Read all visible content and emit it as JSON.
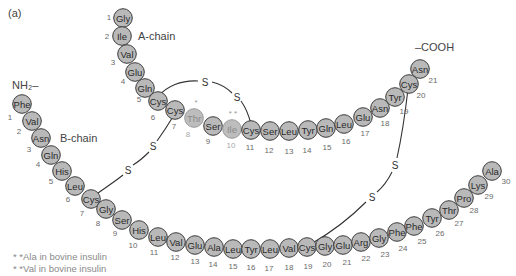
{
  "figure": {
    "panel_label": "(a)",
    "a_chain_label": "A-chain",
    "b_chain_label": "B-chain",
    "n_terminus_label": "NH₂–",
    "c_terminus_label": "–COOH",
    "disulfide_symbol": "S",
    "footnotes": [
      "* *Ala in bovine insulin",
      "* *Val in bovine insulin"
    ],
    "variant_markers": {
      "thr8": "*",
      "ile10": "* *"
    },
    "colors": {
      "residue_fill": "#b9b9b9",
      "residue_stroke": "#3a3a3a",
      "variant_text": "#8a8a8a",
      "bond": "#333333"
    }
  },
  "a_chain": [
    {
      "n": 1,
      "aa": "Gly",
      "x": 123,
      "y": 18,
      "nx": 109,
      "ny": 17
    },
    {
      "n": 2,
      "aa": "Ile",
      "x": 122,
      "y": 36,
      "nx": 107,
      "ny": 36
    },
    {
      "n": 3,
      "aa": "Val",
      "x": 127,
      "y": 54,
      "nx": 113,
      "ny": 62
    },
    {
      "n": 4,
      "aa": "Glu",
      "x": 135,
      "y": 72,
      "nx": 123,
      "ny": 81
    },
    {
      "n": 5,
      "aa": "Gln",
      "x": 145,
      "y": 88,
      "nx": 139,
      "ny": 99
    },
    {
      "n": 6,
      "aa": "Cys",
      "x": 158,
      "y": 101,
      "nx": 153,
      "ny": 117
    },
    {
      "n": 7,
      "aa": "Cys",
      "x": 175,
      "y": 110,
      "nx": 174,
      "ny": 126
    },
    {
      "n": 8,
      "aa": "Thr",
      "x": 194,
      "y": 118,
      "nx": 188,
      "ny": 134,
      "variant": true
    },
    {
      "n": 9,
      "aa": "Ser",
      "x": 213,
      "y": 126,
      "nx": 208,
      "ny": 141
    },
    {
      "n": 10,
      "aa": "Ile",
      "x": 232,
      "y": 129,
      "nx": 231,
      "ny": 145,
      "variant": true
    },
    {
      "n": 11,
      "aa": "Cys",
      "x": 251,
      "y": 130,
      "nx": 250,
      "ny": 147
    },
    {
      "n": 12,
      "aa": "Ser",
      "x": 270,
      "y": 131,
      "nx": 269,
      "ny": 150
    },
    {
      "n": 13,
      "aa": "Leu",
      "x": 289,
      "y": 131,
      "nx": 289,
      "ny": 151
    },
    {
      "n": 14,
      "aa": "Tyr",
      "x": 308,
      "y": 130,
      "nx": 307,
      "ny": 150
    },
    {
      "n": 15,
      "aa": "Gln",
      "x": 326,
      "y": 128,
      "nx": 327,
      "ny": 147
    },
    {
      "n": 16,
      "aa": "Leu",
      "x": 344,
      "y": 124,
      "nx": 346,
      "ny": 141
    },
    {
      "n": 17,
      "aa": "Glu",
      "x": 363,
      "y": 117,
      "nx": 365,
      "ny": 133
    },
    {
      "n": 18,
      "aa": "Asn",
      "x": 380,
      "y": 108,
      "nx": 385,
      "ny": 123
    },
    {
      "n": 19,
      "aa": "Tyr",
      "x": 395,
      "y": 97,
      "nx": 404,
      "ny": 111
    },
    {
      "n": 20,
      "aa": "Cys",
      "x": 409,
      "y": 84,
      "nx": 421,
      "ny": 95
    },
    {
      "n": 21,
      "aa": "Asn",
      "x": 420,
      "y": 69,
      "nx": 433,
      "ny": 80
    }
  ],
  "b_chain": [
    {
      "n": 1,
      "aa": "Phe",
      "x": 22,
      "y": 104,
      "nx": 10,
      "ny": 117
    },
    {
      "n": 2,
      "aa": "Val",
      "x": 32,
      "y": 121,
      "nx": 19,
      "ny": 131
    },
    {
      "n": 3,
      "aa": "Asn",
      "x": 41,
      "y": 138,
      "nx": 29,
      "ny": 149
    },
    {
      "n": 4,
      "aa": "Gln",
      "x": 51,
      "y": 155,
      "nx": 38,
      "ny": 164
    },
    {
      "n": 5,
      "aa": "His",
      "x": 62,
      "y": 171,
      "nx": 51,
      "ny": 181
    },
    {
      "n": 6,
      "aa": "Leu",
      "x": 75,
      "y": 186,
      "nx": 68,
      "ny": 199
    },
    {
      "n": 7,
      "aa": "Cys",
      "x": 91,
      "y": 199,
      "nx": 82,
      "ny": 213
    },
    {
      "n": 8,
      "aa": "Gly",
      "x": 106,
      "y": 209,
      "nx": 98,
      "ny": 223
    },
    {
      "n": 9,
      "aa": "Ser",
      "x": 122,
      "y": 220,
      "nx": 115,
      "ny": 233
    },
    {
      "n": 10,
      "aa": "His",
      "x": 139,
      "y": 230,
      "nx": 133,
      "ny": 245
    },
    {
      "n": 11,
      "aa": "Leu",
      "x": 158,
      "y": 237,
      "nx": 154,
      "ny": 252
    },
    {
      "n": 12,
      "aa": "Val",
      "x": 176,
      "y": 242,
      "nx": 175,
      "ny": 257
    },
    {
      "n": 13,
      "aa": "Glu",
      "x": 195,
      "y": 245,
      "nx": 195,
      "ny": 261
    },
    {
      "n": 14,
      "aa": "Ala",
      "x": 214,
      "y": 247,
      "nx": 213,
      "ny": 264
    },
    {
      "n": 15,
      "aa": "Leu",
      "x": 233,
      "y": 249,
      "nx": 233,
      "ny": 266
    },
    {
      "n": 16,
      "aa": "Tyr",
      "x": 251,
      "y": 249,
      "nx": 251,
      "ny": 267
    },
    {
      "n": 17,
      "aa": "Leu",
      "x": 270,
      "y": 249,
      "nx": 269,
      "ny": 268
    },
    {
      "n": 18,
      "aa": "Val",
      "x": 289,
      "y": 248,
      "nx": 289,
      "ny": 267
    },
    {
      "n": 19,
      "aa": "Cys",
      "x": 307,
      "y": 247,
      "nx": 308,
      "ny": 266
    },
    {
      "n": 20,
      "aa": "Gly",
      "x": 325,
      "y": 246,
      "nx": 327,
      "ny": 264
    },
    {
      "n": 21,
      "aa": "Glu",
      "x": 343,
      "y": 245,
      "nx": 347,
      "ny": 262
    },
    {
      "n": 22,
      "aa": "Arg",
      "x": 361,
      "y": 242,
      "nx": 366,
      "ny": 258
    },
    {
      "n": 23,
      "aa": "Gly",
      "x": 379,
      "y": 238,
      "nx": 385,
      "ny": 254
    },
    {
      "n": 24,
      "aa": "Phe",
      "x": 397,
      "y": 232,
      "nx": 403,
      "ny": 248
    },
    {
      "n": 25,
      "aa": "Phe",
      "x": 414,
      "y": 226,
      "nx": 422,
      "ny": 241
    },
    {
      "n": 26,
      "aa": "Tyr",
      "x": 432,
      "y": 218,
      "nx": 440,
      "ny": 233
    },
    {
      "n": 27,
      "aa": "Thr",
      "x": 449,
      "y": 210,
      "nx": 459,
      "ny": 223
    },
    {
      "n": 28,
      "aa": "Pro",
      "x": 464,
      "y": 198,
      "nx": 474,
      "ny": 210
    },
    {
      "n": 29,
      "aa": "Lys",
      "x": 478,
      "y": 185,
      "nx": 489,
      "ny": 196
    },
    {
      "n": 30,
      "aa": "Ala",
      "x": 492,
      "y": 171,
      "nx": 506,
      "ny": 181
    }
  ],
  "disulfide_bonds": [
    {
      "from": "A6",
      "to": "A11",
      "s_labels": [
        {
          "x": 205,
          "y": 82
        },
        {
          "x": 237,
          "y": 97
        }
      ]
    },
    {
      "from": "A7",
      "to": "B7",
      "s_labels": [
        {
          "x": 153,
          "y": 146
        },
        {
          "x": 128,
          "y": 170
        }
      ]
    },
    {
      "from": "A20",
      "to": "B19",
      "s_labels": [
        {
          "x": 395,
          "y": 165
        },
        {
          "x": 372,
          "y": 197
        }
      ]
    }
  ]
}
